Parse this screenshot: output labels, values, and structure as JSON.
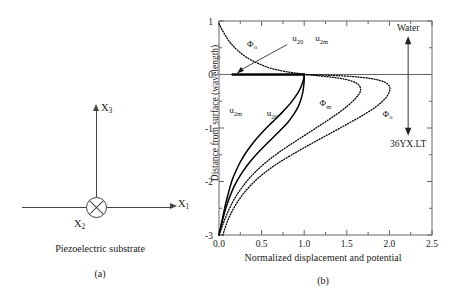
{
  "figure": {
    "panel_a": {
      "axis_x1_label": "X",
      "axis_x1_sub": "1",
      "axis_x3_label": "X",
      "axis_x3_sub": "3",
      "axis_x2_label": "X",
      "axis_x2_sub": "2",
      "substrate_caption": "Piezoelectric substrate",
      "panel_letter": "(a)"
    },
    "panel_b": {
      "panel_letter": "(b)",
      "region_top_label": "Water",
      "region_bottom_label": "36YX.LT"
    }
  },
  "chart_data": {
    "type": "line",
    "title": "",
    "xlabel": "Normalized displacement and potential",
    "ylabel": "Distance from surface (wavelength)",
    "xlim": [
      0.0,
      2.5
    ],
    "ylim": [
      -3,
      1
    ],
    "xticks": [
      "0.0",
      "0.5",
      "1.0",
      "1.5",
      "2.0",
      "2.5"
    ],
    "xtick_values": [
      0.0,
      0.5,
      1.0,
      1.5,
      2.0,
      2.5
    ],
    "yticks": [
      "1",
      "0",
      "-1",
      "-2",
      "-3"
    ],
    "ytick_values": [
      1,
      0,
      -1,
      -2,
      -3
    ],
    "minor_ticks": true,
    "grid": false,
    "legend": "inline-annotations",
    "annotations": [
      {
        "text": "Φ",
        "sub": "o",
        "x": 0.33,
        "y": 0.52,
        "name": "phi-o-upper-label"
      },
      {
        "text": "u",
        "sub": "20",
        "x": 0.86,
        "y": 0.62,
        "name": "u20-u2m-label-part1"
      },
      {
        "text": "u",
        "sub": "2m",
        "x": 1.13,
        "y": 0.62,
        "name": "u20-u2m-label-part2"
      },
      {
        "text": "u",
        "sub": "2m",
        "x": 0.12,
        "y": -0.72,
        "name": "u2m-label"
      },
      {
        "text": "u",
        "sub": "20",
        "x": 0.56,
        "y": -0.78,
        "name": "u20-label"
      },
      {
        "text": "Φ",
        "sub": "m",
        "x": 1.18,
        "y": -0.59,
        "name": "phi-m-label"
      },
      {
        "text": "Φ",
        "sub": "o",
        "x": 1.92,
        "y": -0.79,
        "name": "phi-o-lower-label"
      }
    ],
    "series": [
      {
        "name": "u20",
        "label": "u20",
        "style": "solid",
        "color": "#000000",
        "points": [
          [
            0.0,
            -3.0
          ],
          [
            0.02,
            -2.85
          ],
          [
            0.04,
            -2.7
          ],
          [
            0.06,
            -2.55
          ],
          [
            0.08,
            -2.4
          ],
          [
            0.105,
            -2.25
          ],
          [
            0.13,
            -2.1
          ],
          [
            0.16,
            -1.95
          ],
          [
            0.2,
            -1.8
          ],
          [
            0.245,
            -1.65
          ],
          [
            0.3,
            -1.5
          ],
          [
            0.365,
            -1.35
          ],
          [
            0.44,
            -1.2
          ],
          [
            0.525,
            -1.05
          ],
          [
            0.62,
            -0.9
          ],
          [
            0.715,
            -0.75
          ],
          [
            0.805,
            -0.6
          ],
          [
            0.88,
            -0.45
          ],
          [
            0.935,
            -0.32
          ],
          [
            0.97,
            -0.2
          ],
          [
            0.99,
            -0.1
          ],
          [
            1.0,
            -0.03
          ],
          [
            1.0,
            0.0
          ]
        ]
      },
      {
        "name": "u2m",
        "label": "u2m",
        "style": "solid",
        "color": "#000000",
        "points": [
          [
            0.0,
            -3.0
          ],
          [
            0.022,
            -2.85
          ],
          [
            0.045,
            -2.7
          ],
          [
            0.07,
            -2.55
          ],
          [
            0.1,
            -2.4
          ],
          [
            0.135,
            -2.25
          ],
          [
            0.175,
            -2.1
          ],
          [
            0.225,
            -1.95
          ],
          [
            0.285,
            -1.8
          ],
          [
            0.355,
            -1.65
          ],
          [
            0.435,
            -1.5
          ],
          [
            0.525,
            -1.35
          ],
          [
            0.62,
            -1.2
          ],
          [
            0.715,
            -1.05
          ],
          [
            0.805,
            -0.9
          ],
          [
            0.875,
            -0.75
          ],
          [
            0.93,
            -0.6
          ],
          [
            0.965,
            -0.45
          ],
          [
            0.985,
            -0.32
          ],
          [
            0.995,
            -0.2
          ],
          [
            1.0,
            -0.1
          ],
          [
            1.0,
            -0.03
          ],
          [
            1.0,
            0.0
          ]
        ]
      },
      {
        "name": "u20_u2m_water",
        "label": "u20, u2m in water",
        "style": "dotted-heavy",
        "color": "#000000",
        "points": [
          [
            0.16,
            0.0
          ],
          [
            0.3,
            0.0
          ],
          [
            0.5,
            0.0
          ],
          [
            0.7,
            0.0
          ],
          [
            0.85,
            0.0
          ],
          [
            0.95,
            0.0
          ],
          [
            1.0,
            0.0
          ]
        ]
      },
      {
        "name": "phi_o_water",
        "label": "Phi_o in water",
        "style": "dotted",
        "color": "#000000",
        "points": [
          [
            0.0,
            0.95
          ],
          [
            0.035,
            0.84
          ],
          [
            0.075,
            0.73
          ],
          [
            0.12,
            0.62
          ],
          [
            0.175,
            0.52
          ],
          [
            0.24,
            0.42
          ],
          [
            0.315,
            0.33
          ],
          [
            0.4,
            0.25
          ],
          [
            0.5,
            0.18
          ],
          [
            0.6,
            0.12
          ],
          [
            0.72,
            0.075
          ],
          [
            0.84,
            0.04
          ],
          [
            0.95,
            0.015
          ],
          [
            1.0,
            0.0
          ]
        ]
      },
      {
        "name": "phi_m",
        "label": "Phi_m",
        "style": "dotted",
        "color": "#000000",
        "points": [
          [
            0.0,
            -3.0
          ],
          [
            0.035,
            -2.85
          ],
          [
            0.07,
            -2.7
          ],
          [
            0.11,
            -2.55
          ],
          [
            0.155,
            -2.4
          ],
          [
            0.21,
            -2.25
          ],
          [
            0.275,
            -2.1
          ],
          [
            0.35,
            -1.95
          ],
          [
            0.44,
            -1.8
          ],
          [
            0.545,
            -1.65
          ],
          [
            0.665,
            -1.5
          ],
          [
            0.8,
            -1.35
          ],
          [
            0.945,
            -1.2
          ],
          [
            1.09,
            -1.05
          ],
          [
            1.235,
            -0.9
          ],
          [
            1.375,
            -0.75
          ],
          [
            1.5,
            -0.6
          ],
          [
            1.6,
            -0.45
          ],
          [
            1.655,
            -0.33
          ],
          [
            1.655,
            -0.23
          ],
          [
            1.6,
            -0.15
          ],
          [
            1.48,
            -0.09
          ],
          [
            1.32,
            -0.05
          ],
          [
            1.15,
            -0.02
          ],
          [
            1.0,
            0.0
          ]
        ]
      },
      {
        "name": "phi_o_substrate",
        "label": "Phi_o substrate",
        "style": "dotted",
        "color": "#000000",
        "points": [
          [
            0.045,
            -3.0
          ],
          [
            0.075,
            -2.85
          ],
          [
            0.11,
            -2.7
          ],
          [
            0.155,
            -2.55
          ],
          [
            0.21,
            -2.4
          ],
          [
            0.275,
            -2.25
          ],
          [
            0.355,
            -2.1
          ],
          [
            0.45,
            -1.95
          ],
          [
            0.565,
            -1.8
          ],
          [
            0.7,
            -1.65
          ],
          [
            0.855,
            -1.5
          ],
          [
            1.02,
            -1.35
          ],
          [
            1.19,
            -1.2
          ],
          [
            1.365,
            -1.05
          ],
          [
            1.535,
            -0.9
          ],
          [
            1.7,
            -0.75
          ],
          [
            1.845,
            -0.6
          ],
          [
            1.95,
            -0.45
          ],
          [
            2.0,
            -0.32
          ],
          [
            2.0,
            -0.22
          ],
          [
            1.94,
            -0.14
          ],
          [
            1.8,
            -0.08
          ],
          [
            1.58,
            -0.04
          ],
          [
            1.3,
            -0.015
          ],
          [
            1.0,
            0.0
          ]
        ]
      }
    ],
    "boundary_arrow": {
      "top_label": "Water",
      "bottom_label": "36YX.LT",
      "x": 2.22,
      "y_top": 0.62,
      "y_bottom": -1.05
    }
  }
}
